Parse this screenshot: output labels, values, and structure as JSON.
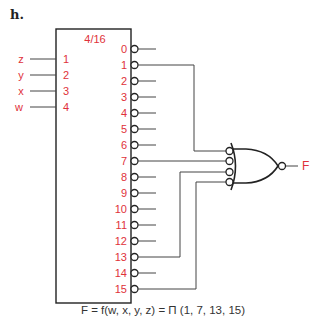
{
  "heading": "h.",
  "decoder": {
    "label": "4/16",
    "inputs": [
      {
        "var": "z",
        "pin": "1"
      },
      {
        "var": "y",
        "pin": "2"
      },
      {
        "var": "x",
        "pin": "3"
      },
      {
        "var": "w",
        "pin": "4"
      }
    ],
    "outputs": [
      "0",
      "1",
      "2",
      "3",
      "4",
      "5",
      "6",
      "7",
      "8",
      "9",
      "10",
      "11",
      "12",
      "13",
      "14",
      "15"
    ],
    "connected_outputs": [
      "1",
      "7",
      "13",
      "15"
    ]
  },
  "gate": {
    "type": "NAND (drawn as OR with inverted inputs)",
    "output_label": "F"
  },
  "formula": "F = f(w, x, y, z) = Π (1, 7, 13, 15)",
  "colors": {
    "label": "#e0323a",
    "line": "#444444",
    "text": "#333333"
  }
}
